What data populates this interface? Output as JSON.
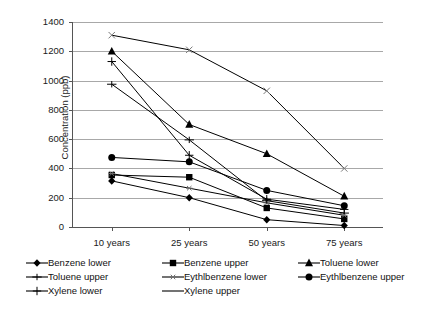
{
  "chart_data": {
    "type": "line",
    "title": "",
    "xlabel": "",
    "ylabel": "Concentration (ppb)",
    "categories": [
      "10 years",
      "25 years",
      "50 years",
      "75 years"
    ],
    "ylim": [
      0,
      1400
    ],
    "ytick_values": [
      0,
      200,
      400,
      600,
      800,
      1000,
      1200,
      1400
    ],
    "ytick_labels": [
      "0",
      "200",
      "400",
      "600",
      "800",
      "1000",
      "1200",
      "1400"
    ],
    "grid": true,
    "legend_position": "bottom",
    "series": [
      {
        "name": "Benzene lower",
        "marker": "diamond",
        "values": [
          315,
          200,
          50,
          10
        ]
      },
      {
        "name": "Benzene upper",
        "marker": "square",
        "values": [
          355,
          340,
          130,
          55
        ]
      },
      {
        "name": "Toluene lower",
        "marker": "triangle",
        "values": [
          1200,
          700,
          500,
          210
        ]
      },
      {
        "name": "Toluene upper",
        "marker": "cross-bar",
        "values": [
          975,
          595,
          180,
          95
        ]
      },
      {
        "name": "Eythlbenzene lower",
        "marker": "asterisk",
        "values": [
          365,
          265,
          165,
          80
        ]
      },
      {
        "name": "Eythlbenzene upper",
        "marker": "circle",
        "values": [
          475,
          445,
          250,
          145
        ]
      },
      {
        "name": "Xylene lower",
        "marker": "plus",
        "values": [
          1130,
          490,
          190,
          120
        ]
      },
      {
        "name": "Xylene upper",
        "marker": "x-cross",
        "values": [
          1310,
          1210,
          930,
          400
        ]
      }
    ]
  },
  "legend": {
    "rows": [
      [
        {
          "label": "Benzene lower",
          "marker": "diamond"
        },
        {
          "label": "Benzene upper",
          "marker": "square"
        },
        {
          "label": "Toluene lower",
          "marker": "triangle"
        }
      ],
      [
        {
          "label": "Toluene upper",
          "marker": "cross-bar"
        },
        {
          "label": "Eythlbenzene lower",
          "marker": "asterisk"
        },
        {
          "label": "Eythlbenzene upper",
          "marker": "circle"
        }
      ],
      [
        {
          "label": "Xylene lower",
          "marker": "plus"
        },
        {
          "label": "Xylene upper",
          "marker": "x-cross"
        }
      ]
    ]
  },
  "colors": {
    "line": "#000000",
    "marker": "#000000",
    "grid": "#a8a8a8",
    "axis": "#555555",
    "text": "#1a1a1a",
    "background": "#ffffff"
  }
}
